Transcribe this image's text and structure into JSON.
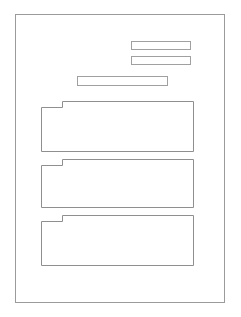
{
  "document": {
    "title": "Wireframe Layout Mockup",
    "background_color": "#ffffff",
    "frame": {
      "name": "page-frame",
      "border_color": "#9b9b9b",
      "x": 15,
      "y": 14,
      "width": 210,
      "height": 289,
      "label": ""
    }
  },
  "bars": [
    {
      "name": "bar-top-1",
      "label": "",
      "x": 131,
      "y": 41,
      "width": 60,
      "height": 9,
      "border_color": "#a0a0a0",
      "fill_color": "#ffffff"
    },
    {
      "name": "bar-top-2",
      "label": "",
      "x": 131,
      "y": 56,
      "width": 60,
      "height": 9,
      "border_color": "#a0a0a0",
      "fill_color": "#ffffff"
    },
    {
      "name": "bar-wide",
      "label": "",
      "x": 77,
      "y": 76,
      "width": 91,
      "height": 10,
      "border_color": "#a0a0a0",
      "fill_color": "#ffffff"
    }
  ],
  "blocks": [
    {
      "name": "content-block-1",
      "label": "",
      "x": 41,
      "y": 101,
      "width": 153,
      "height": 51,
      "tab_width": 22,
      "tab_drop": 6,
      "border_color": "#8f8f8f",
      "fill_color": "#ffffff"
    },
    {
      "name": "content-block-2",
      "label": "",
      "x": 41,
      "y": 159,
      "width": 153,
      "height": 49,
      "tab_width": 22,
      "tab_drop": 6,
      "border_color": "#8f8f8f",
      "fill_color": "#ffffff"
    },
    {
      "name": "content-block-3",
      "label": "",
      "x": 41,
      "y": 215,
      "width": 153,
      "height": 51,
      "tab_width": 22,
      "tab_drop": 6,
      "border_color": "#8f8f8f",
      "fill_color": "#ffffff"
    }
  ]
}
